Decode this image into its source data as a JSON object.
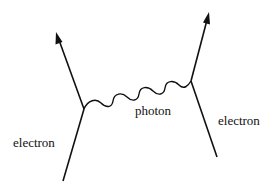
{
  "diagram": {
    "type": "feynman-diagram",
    "labels": {
      "left_electron": "electron",
      "photon": "photon",
      "right_electron": "electron"
    },
    "colors": {
      "stroke": "#111111",
      "background": "#ffffff"
    }
  }
}
